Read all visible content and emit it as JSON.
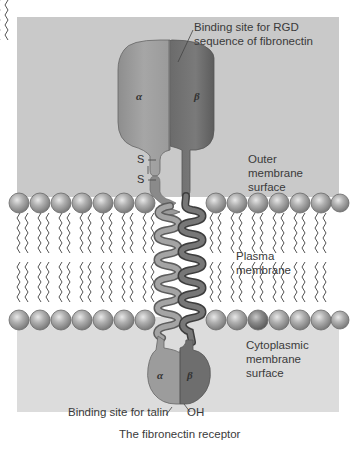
{
  "figure": {
    "caption": "The fibronectin receptor",
    "colors": {
      "outer_background": "#c9c9c9",
      "membrane_interior": "#ffffff",
      "cytoplasm_background": "#dedede",
      "alpha_subunit": "#9c9c9c",
      "beta_subunit": "#6f6f6f",
      "lipid_head": "#a8a8a8",
      "lipid_tail": "#555555"
    }
  },
  "labels": {
    "rgd_binding_site": "Binding site for RGD\nsequence of fibronectin",
    "outer_surface": "Outer\nmembrane\nsurface",
    "plasma_membrane": "Plasma\nmembrane",
    "cytoplasmic_surface": "Cytoplasmic\nmembrane\nsurface",
    "talin_binding_site": "Binding site for talin",
    "oh_terminus": "OH",
    "disulfide_top": "S",
    "disulfide_bottom": "S"
  },
  "subunits": {
    "alpha": "α",
    "beta": "β"
  }
}
